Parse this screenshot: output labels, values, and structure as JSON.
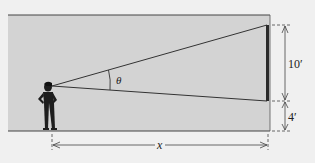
{
  "figure": {
    "type": "geometry-diagram",
    "labels": {
      "angle": "θ",
      "screen_height": "10′",
      "screen_base_height": "4′",
      "distance": "x"
    },
    "colors": {
      "background": "#f0f0f0",
      "panel": "#d2d2d2",
      "lines": "#333333",
      "screen": "#2a2a2a"
    }
  }
}
